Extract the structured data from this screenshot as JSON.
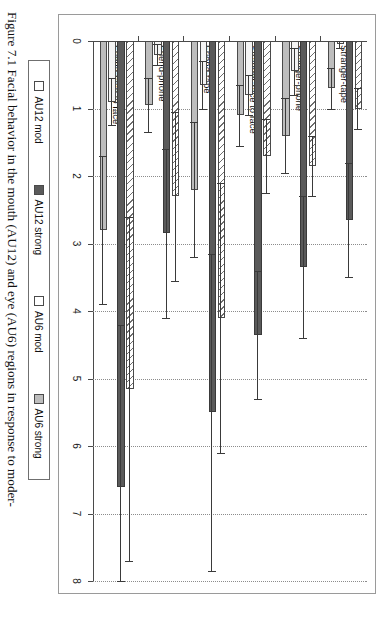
{
  "figure": {
    "caption_line1": "Figure 7.1 Facial behavior in the mouth (AU12) and eye (AU6) regions in response to moder-",
    "caption_line2": "ately funny stimuli in the presence of a stranger or a friend."
  },
  "legend": {
    "items": [
      {
        "label": "AU12 mod",
        "key": "au12mod",
        "color": "#ffffff"
      },
      {
        "label": "AU12 strong",
        "key": "au12strong",
        "color": "#5a5a5a"
      },
      {
        "label": "AU6 mod",
        "key": "au6mod",
        "color": "#ffffff"
      },
      {
        "label": "AU6 strong",
        "key": "au6strong",
        "color": "#bdbdbd"
      }
    ]
  },
  "chart_data": {
    "type": "bar",
    "orientation": "horizontal",
    "title": "",
    "xlabel": "",
    "ylabel": "",
    "xlim": [
      0,
      8
    ],
    "xticks": [
      "0",
      "1",
      "2",
      "3",
      "4",
      "5",
      "6",
      "7",
      "8"
    ],
    "grid": true,
    "legend_position": "bottom",
    "categories": [
      "Stranger-tape",
      "Stranger-phone",
      "Stranger-face to face",
      "Friend-tape",
      "Friend-phone",
      "Friend-face to face"
    ],
    "series": [
      {
        "name": "AU12 mod",
        "key": "au12mod",
        "values": [
          1.0,
          1.85,
          1.7,
          4.1,
          2.3,
          5.15
        ],
        "errors": [
          0.3,
          0.45,
          0.55,
          2.0,
          1.25,
          2.55
        ]
      },
      {
        "name": "AU12 strong",
        "key": "au12strong",
        "values": [
          2.65,
          3.35,
          4.35,
          5.5,
          2.85,
          6.6
        ],
        "errors": [
          0.85,
          1.05,
          0.95,
          2.35,
          1.25,
          2.4
        ]
      },
      {
        "name": "AU6 mod",
        "key": "au6mod",
        "values": [
          0.05,
          0.45,
          0.8,
          0.65,
          0.2,
          0.9
        ],
        "errors": [
          0.05,
          0.35,
          0.3,
          0.35,
          0.15,
          0.35
        ]
      },
      {
        "name": "AU6 strong",
        "key": "au6strong",
        "values": [
          0.7,
          1.4,
          1.1,
          2.2,
          0.95,
          2.8
        ],
        "errors": [
          0.3,
          0.55,
          0.45,
          1.0,
          0.4,
          1.1
        ]
      }
    ]
  }
}
